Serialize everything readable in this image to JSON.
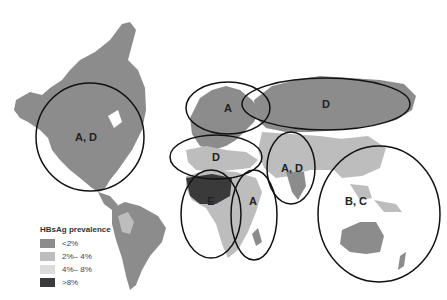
{
  "legend": {
    "title": "HBsAg prevalence",
    "items": [
      {
        "label": "<2%",
        "color": "#8c8c8c"
      },
      {
        "label": "2%– 4%",
        "color": "#bdbdbd"
      },
      {
        "label": "4%– 8%",
        "color": "#dcdcdc"
      },
      {
        "label": ">8%",
        "color": "#3a3a3a"
      }
    ]
  },
  "regions": [
    {
      "id": "north-america",
      "label": "A, D",
      "cx": 90,
      "cy": 137,
      "rx": 54,
      "ry": 54
    },
    {
      "id": "northern-europe",
      "label": "A",
      "cx": 228,
      "cy": 108,
      "rx": 42,
      "ry": 26
    },
    {
      "id": "russia",
      "label": "D",
      "cx": 326,
      "cy": 104,
      "rx": 84,
      "ry": 26
    },
    {
      "id": "southern-europe",
      "label": "D",
      "cx": 216,
      "cy": 157,
      "rx": 46,
      "ry": 22
    },
    {
      "id": "middle-east-india",
      "label": "A, D",
      "cx": 291,
      "cy": 168,
      "rx": 24,
      "ry": 36
    },
    {
      "id": "west-africa",
      "label": "E",
      "cx": 211,
      "cy": 214,
      "rx": 30,
      "ry": 44
    },
    {
      "id": "east-africa",
      "label": "A",
      "cx": 254,
      "cy": 215,
      "rx": 23,
      "ry": 45
    },
    {
      "id": "asia-pacific",
      "label": "B, C",
      "cx": 379,
      "cy": 214,
      "rx": 61,
      "ry": 68
    }
  ]
}
